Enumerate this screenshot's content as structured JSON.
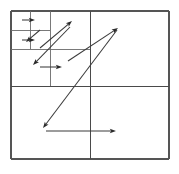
{
  "figure": {
    "title": "Quadtree motion vector field",
    "type": "diagram",
    "canvas": {
      "width": 179,
      "height": 174
    },
    "colors": {
      "background": "#ffffff",
      "grid": "#4a4a4a",
      "grid_outer": "#555555",
      "grid_sub": "#6a6a6a",
      "arrow": "#3a3a3a",
      "arrow_head": "#2a2a2a"
    }
  },
  "grid": {
    "bounds": {
      "x0": 11,
      "y0": 11,
      "x1": 169,
      "y1": 159
    },
    "outer_rect": {
      "x": 11,
      "y": 11,
      "width": 158,
      "height": 148
    },
    "lines": [
      {
        "name": "outer-top",
        "x1": 11,
        "y1": 11,
        "x2": 169,
        "y2": 11,
        "level": "outer"
      },
      {
        "name": "outer-right",
        "x1": 169,
        "y1": 11,
        "x2": 169,
        "y2": 159,
        "level": "outer"
      },
      {
        "name": "outer-bottom",
        "x1": 11,
        "y1": 159,
        "x2": 169,
        "y2": 159,
        "level": "outer"
      },
      {
        "name": "outer-left",
        "x1": 11,
        "y1": 11,
        "x2": 11,
        "y2": 159,
        "level": "outer"
      },
      {
        "name": "root-horizontal",
        "x1": 11,
        "y1": 86,
        "x2": 169,
        "y2": 86,
        "level": "root"
      },
      {
        "name": "root-vertical",
        "x1": 90,
        "y1": 11,
        "x2": 90,
        "y2": 159,
        "level": "root"
      },
      {
        "name": "q1-horizontal",
        "x1": 11,
        "y1": 49,
        "x2": 90,
        "y2": 49,
        "level": "sub"
      },
      {
        "name": "q1-vertical",
        "x1": 50,
        "y1": 11,
        "x2": 50,
        "y2": 86,
        "level": "sub"
      },
      {
        "name": "q1a-horizontal",
        "x1": 11,
        "y1": 30,
        "x2": 50,
        "y2": 30,
        "level": "sub2"
      },
      {
        "name": "q1a-vertical",
        "x1": 30,
        "y1": 11,
        "x2": 30,
        "y2": 49,
        "level": "sub2"
      }
    ]
  },
  "vectors": [
    {
      "name": "vector-block-a1",
      "x1": 22,
      "y1": 20,
      "x2": 35,
      "y2": 20,
      "label": "short right arrow, top-left sub-block"
    },
    {
      "name": "vector-block-a2",
      "x1": 40,
      "y1": 30,
      "x2": 26,
      "y2": 42,
      "label": "short down-left arrow"
    },
    {
      "name": "vector-block-a3",
      "x1": 22,
      "y1": 40,
      "x2": 35,
      "y2": 40,
      "label": "short right arrow, second row sub-block"
    },
    {
      "name": "vector-block-b",
      "x1": 40,
      "y1": 48,
      "x2": 72,
      "y2": 21,
      "label": "long up-right arrow into top-right sub-block"
    },
    {
      "name": "vector-block-c",
      "x1": 70,
      "y1": 27,
      "x2": 33,
      "y2": 65,
      "label": "long down-left arrow crossing sub-blocks"
    },
    {
      "name": "vector-block-d",
      "x1": 40,
      "y1": 67,
      "x2": 62,
      "y2": 67,
      "label": "horizontal right arrow, lower-left sub-block"
    },
    {
      "name": "vector-block-e",
      "x1": 68,
      "y1": 61,
      "x2": 118,
      "y2": 28,
      "label": "long up-right arrow into top-right quadrant"
    },
    {
      "name": "vector-block-f",
      "x1": 117,
      "y1": 30,
      "x2": 43,
      "y2": 128,
      "label": "long down-left arrow spanning lower-left quadrant"
    },
    {
      "name": "vector-block-g",
      "x1": 46,
      "y1": 131,
      "x2": 116,
      "y2": 131,
      "label": "long horizontal right arrow, bottom quadrants"
    }
  ]
}
